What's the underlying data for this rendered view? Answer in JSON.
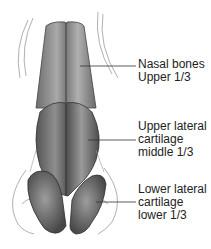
{
  "diagram": {
    "labels": [
      {
        "id": "nasal-bones",
        "lines": [
          "Nasal bones",
          "Upper 1/3"
        ]
      },
      {
        "id": "upper-lateral-cartilage",
        "lines": [
          "Upper lateral",
          "cartilage",
          "middle 1/3"
        ]
      },
      {
        "id": "lower-lateral-cartilage",
        "lines": [
          "Lower lateral",
          "cartilage",
          "lower 1/3"
        ]
      }
    ]
  }
}
